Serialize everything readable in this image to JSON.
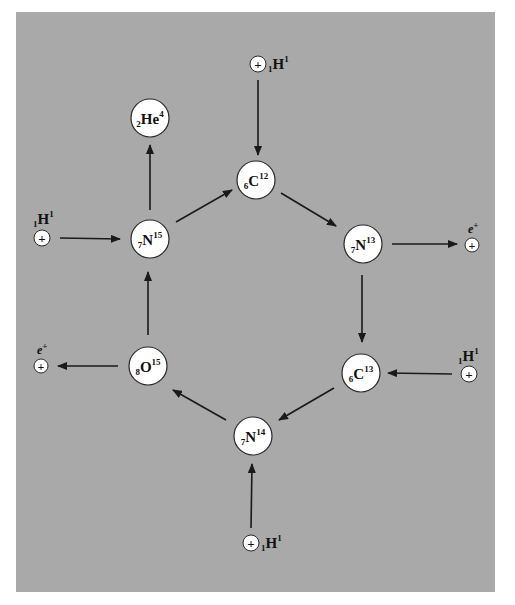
{
  "colors": {
    "background": "#a9a9a9",
    "node_fill": "#ffffff",
    "stroke": "#1a1a1a"
  },
  "nuclei": [
    {
      "id": "C12",
      "symbol": "C",
      "z": "6",
      "a": "12"
    },
    {
      "id": "N13",
      "symbol": "N",
      "z": "7",
      "a": "13"
    },
    {
      "id": "C13",
      "symbol": "C",
      "z": "6",
      "a": "13"
    },
    {
      "id": "N14",
      "symbol": "N",
      "z": "7",
      "a": "14"
    },
    {
      "id": "O15",
      "symbol": "O",
      "z": "8",
      "a": "15"
    },
    {
      "id": "N15",
      "symbol": "N",
      "z": "7",
      "a": "15"
    },
    {
      "id": "He4",
      "symbol": "He",
      "z": "2",
      "a": "4"
    }
  ],
  "protons": [
    {
      "id": "p1",
      "symbol": "H",
      "z": "1",
      "a": "1",
      "into": "C12"
    },
    {
      "id": "p2",
      "symbol": "H",
      "z": "1",
      "a": "1",
      "into": "C13"
    },
    {
      "id": "p3",
      "symbol": "H",
      "z": "1",
      "a": "1",
      "into": "N14"
    },
    {
      "id": "p4",
      "symbol": "H",
      "z": "1",
      "a": "1",
      "into": "N15"
    }
  ],
  "positrons": [
    {
      "id": "e1",
      "symbol": "e",
      "charge": "+",
      "from": "N13"
    },
    {
      "id": "e2",
      "symbol": "e",
      "charge": "+",
      "from": "O15"
    }
  ],
  "plus_glyph": "+"
}
